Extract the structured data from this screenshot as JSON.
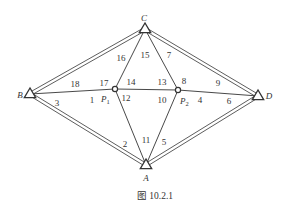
{
  "diagram": {
    "caption": "图 10.2.1",
    "colors": {
      "line": "#333333",
      "background": "#ffffff"
    },
    "control_points": [
      {
        "id": "A",
        "label": "A",
        "x": 146,
        "y": 165,
        "lx": 146,
        "ly": 181
      },
      {
        "id": "B",
        "label": "B",
        "x": 30,
        "y": 94,
        "lx": 20,
        "ly": 98
      },
      {
        "id": "C",
        "label": "C",
        "x": 145,
        "y": 29,
        "lx": 144,
        "ly": 21
      },
      {
        "id": "D",
        "label": "D",
        "x": 258,
        "y": 96,
        "lx": 269,
        "ly": 99
      }
    ],
    "unknown_points": [
      {
        "id": "P1",
        "label": "P",
        "sub": "1",
        "x": 115,
        "y": 89,
        "lx": 101,
        "ly": 102
      },
      {
        "id": "P2",
        "label": "P",
        "sub": "2",
        "x": 178,
        "y": 90,
        "lx": 180,
        "ly": 104
      }
    ],
    "known_edges": [
      [
        "B",
        "C"
      ],
      [
        "C",
        "D"
      ],
      [
        "D",
        "A"
      ],
      [
        "A",
        "B"
      ]
    ],
    "observed_edges": [
      [
        "B",
        "P1"
      ],
      [
        "P1",
        "P2"
      ],
      [
        "P2",
        "D"
      ],
      [
        "C",
        "P1"
      ],
      [
        "C",
        "P2"
      ],
      [
        "A",
        "P1"
      ],
      [
        "A",
        "P2"
      ]
    ],
    "angle_labels": [
      {
        "n": "1",
        "x": 92,
        "y": 103
      },
      {
        "n": "2",
        "x": 125,
        "y": 147
      },
      {
        "n": "3",
        "x": 57,
        "y": 106
      },
      {
        "n": "4",
        "x": 200,
        "y": 103
      },
      {
        "n": "5",
        "x": 164,
        "y": 145
      },
      {
        "n": "6",
        "x": 229,
        "y": 104
      },
      {
        "n": "7",
        "x": 169,
        "y": 58
      },
      {
        "n": "8",
        "x": 184,
        "y": 84
      },
      {
        "n": "9",
        "x": 218,
        "y": 86
      },
      {
        "n": "10",
        "x": 162,
        "y": 103
      },
      {
        "n": "11",
        "x": 146,
        "y": 143
      },
      {
        "n": "12",
        "x": 126,
        "y": 101
      },
      {
        "n": "13",
        "x": 162,
        "y": 85
      },
      {
        "n": "14",
        "x": 131,
        "y": 85
      },
      {
        "n": "15",
        "x": 145,
        "y": 58
      },
      {
        "n": "16",
        "x": 121,
        "y": 61
      },
      {
        "n": "17",
        "x": 104,
        "y": 86
      },
      {
        "n": "18",
        "x": 75,
        "y": 87
      }
    ]
  }
}
